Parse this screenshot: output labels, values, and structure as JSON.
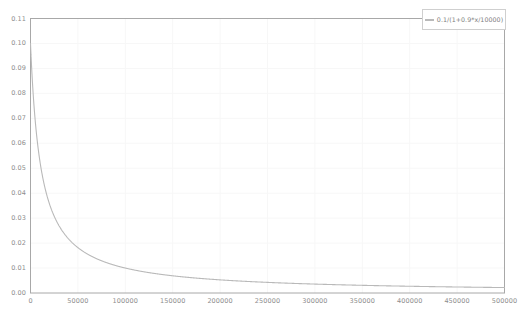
{
  "chart_data": {
    "type": "line",
    "title": "",
    "xlabel": "",
    "ylabel": "",
    "xlim": [
      0,
      500000
    ],
    "ylim": [
      0,
      0.11
    ],
    "grid": true,
    "legend_position": "top-right",
    "xticks": [
      0,
      50000,
      100000,
      150000,
      200000,
      250000,
      300000,
      350000,
      400000,
      450000,
      500000
    ],
    "xtick_labels": [
      "0",
      "50000",
      "100000",
      "150000",
      "200000",
      "250000",
      "300000",
      "350000",
      "400000",
      "450000",
      "500000"
    ],
    "yticks": [
      0.0,
      0.01,
      0.02,
      0.03,
      0.04,
      0.05,
      0.06,
      0.07,
      0.08,
      0.09,
      0.1,
      0.11
    ],
    "ytick_labels": [
      "0.00",
      "0.01",
      "0.02",
      "0.03",
      "0.04",
      "0.05",
      "0.06",
      "0.07",
      "0.08",
      "0.09",
      "0.10",
      "0.11"
    ],
    "series": [
      {
        "name": "0.1/(1+0.9*x/10000)",
        "color": "#b9b9b9",
        "formula": "0.1/(1+0.9*x/10000)",
        "x": [
          0,
          2000,
          4000,
          6000,
          8000,
          10000,
          15000,
          20000,
          25000,
          30000,
          40000,
          50000,
          60000,
          75000,
          100000,
          125000,
          150000,
          175000,
          200000,
          250000,
          300000,
          350000,
          400000,
          450000,
          500000
        ],
        "y": [
          0.1,
          0.0847,
          0.0735,
          0.0649,
          0.0581,
          0.0526,
          0.0426,
          0.0357,
          0.0308,
          0.027,
          0.0217,
          0.0182,
          0.0156,
          0.0128,
          0.0099,
          0.0079,
          0.0066,
          0.0057,
          0.005,
          0.004,
          0.0033,
          0.0028,
          0.0025,
          0.0022,
          0.002
        ]
      }
    ]
  },
  "legend": {
    "entries": [
      {
        "label": "0.1/(1+0.9*x/10000)",
        "color": "#b9b9b9"
      }
    ]
  },
  "axes": {
    "frame_color": "#a8a8a8",
    "grid_color": "#f7f7f7",
    "tick_color": "#8d8d8d"
  }
}
